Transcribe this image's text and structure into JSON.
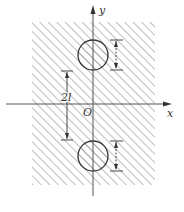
{
  "diagram": {
    "axes": {
      "x_label": "x",
      "y_label": "y",
      "origin_label": "O"
    },
    "dimensions": {
      "center_distance_label": "2l"
    },
    "region": {
      "x": 32,
      "y": 22,
      "width": 123,
      "height": 163,
      "hatch": "diagonal"
    },
    "holes": [
      {
        "name": "upper-hole",
        "cx": 93,
        "cy": 55,
        "r": 15
      },
      {
        "name": "lower-hole",
        "cx": 93,
        "cy": 156,
        "r": 15
      }
    ],
    "colors": {
      "line": "#333333",
      "hatch": "#7a7a7a",
      "background": "#ffffff"
    }
  }
}
